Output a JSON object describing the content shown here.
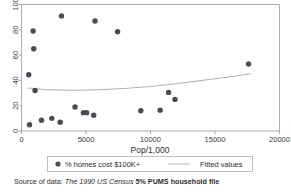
{
  "chart_data": {
    "type": "scatter",
    "title": "",
    "xlabel": "Pop/1,000",
    "ylabel": "",
    "xlim": [
      0,
      20000
    ],
    "ylim": [
      0,
      100
    ],
    "xticks": [
      0,
      5000,
      10000,
      15000,
      20000
    ],
    "xtick_labels": [
      "0",
      "5000",
      "10000",
      "15000",
      "20000"
    ],
    "yticks": [
      0,
      20,
      40,
      60,
      80,
      100
    ],
    "ytick_labels": [
      "0",
      "20",
      "40",
      "60",
      "80",
      "100"
    ],
    "grid": false,
    "legend_position": "below-axis",
    "series": [
      {
        "name": "% homes cost $100K+",
        "type": "scatter",
        "marker": "filled-circle",
        "color": "#4a4a55",
        "points": [
          {
            "x": 560,
            "y": 44.5
          },
          {
            "x": 620,
            "y": 5.0
          },
          {
            "x": 900,
            "y": 79.0
          },
          {
            "x": 950,
            "y": 65.0
          },
          {
            "x": 1050,
            "y": 32.0
          },
          {
            "x": 1550,
            "y": 8.5
          },
          {
            "x": 2350,
            "y": 10.0
          },
          {
            "x": 3000,
            "y": 7.0
          },
          {
            "x": 3100,
            "y": 91.0
          },
          {
            "x": 4150,
            "y": 19.0
          },
          {
            "x": 4800,
            "y": 14.5
          },
          {
            "x": 5050,
            "y": 14.5
          },
          {
            "x": 5600,
            "y": 12.5
          },
          {
            "x": 5700,
            "y": 87.0
          },
          {
            "x": 7450,
            "y": 78.5
          },
          {
            "x": 9250,
            "y": 16.0
          },
          {
            "x": 10750,
            "y": 16.5
          },
          {
            "x": 11400,
            "y": 30.5
          },
          {
            "x": 11900,
            "y": 25.0
          },
          {
            "x": 17600,
            "y": 53.0
          }
        ]
      },
      {
        "name": "Fitted values",
        "type": "line",
        "color": "#9a9a9a",
        "points": [
          {
            "x": 500,
            "y": 34.0
          },
          {
            "x": 2000,
            "y": 32.6
          },
          {
            "x": 4000,
            "y": 32.2
          },
          {
            "x": 6000,
            "y": 32.6
          },
          {
            "x": 8000,
            "y": 33.6
          },
          {
            "x": 10000,
            "y": 35.2
          },
          {
            "x": 12000,
            "y": 37.4
          },
          {
            "x": 14000,
            "y": 40.0
          },
          {
            "x": 16000,
            "y": 42.6
          },
          {
            "x": 17800,
            "y": 45.2
          }
        ]
      }
    ]
  },
  "legend": {
    "entries": [
      {
        "label": "% homes cost $100K+",
        "marker": "filled-circle"
      },
      {
        "label": "Fitted values",
        "marker": "line"
      }
    ]
  },
  "note": {
    "prefix": "Source of data: ",
    "italic": "The 1990 US Census",
    "bold_pct": " 5%",
    "bold_rest": " PUMS household file"
  },
  "colors": {
    "point": "#4a4a55",
    "fit_line": "#9a9a9a",
    "axis": "#999999",
    "text": "#2d2d2d",
    "background": "#ffffff"
  }
}
